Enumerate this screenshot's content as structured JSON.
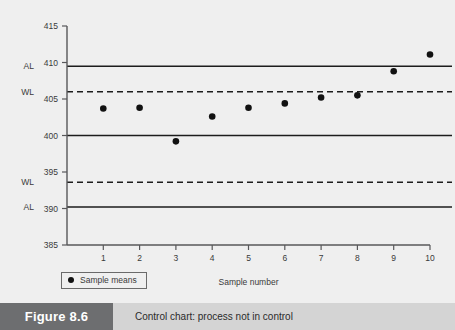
{
  "figure": {
    "number_label": "Figure 8.6",
    "caption": "Control chart: process not in control"
  },
  "legend": {
    "marker_name": "filled-circle-marker",
    "label": "Sample means"
  },
  "chart_data": {
    "type": "scatter",
    "title": "",
    "xlabel": "Sample number",
    "ylabel": "",
    "x": [
      1,
      2,
      3,
      4,
      5,
      6,
      7,
      8,
      9,
      10
    ],
    "categories": [
      "1",
      "2",
      "3",
      "4",
      "5",
      "6",
      "7",
      "8",
      "9",
      "10"
    ],
    "series": [
      {
        "name": "Sample means",
        "values": [
          403.7,
          403.8,
          399.2,
          402.6,
          403.8,
          404.4,
          405.2,
          405.5,
          408.8,
          411.1
        ]
      }
    ],
    "xlim": [
      0,
      10
    ],
    "ylim": [
      385,
      415
    ],
    "xticks": [
      1,
      2,
      3,
      4,
      5,
      6,
      7,
      8,
      9,
      10
    ],
    "yticks": [
      385,
      390,
      395,
      400,
      405,
      410,
      415
    ],
    "ytick_labels": [
      "385",
      "390",
      "395",
      "400",
      "405",
      "410",
      "415"
    ],
    "grid": false,
    "legend_position": "bottom-left",
    "reference_lines": [
      {
        "name": "upper-action-limit",
        "tag": "AL",
        "value": 409.5,
        "style": "solid"
      },
      {
        "name": "upper-warning-limit",
        "tag": "WL",
        "value": 406.0,
        "style": "dashed"
      },
      {
        "name": "center-line",
        "tag": "",
        "value": 400.0,
        "style": "solid"
      },
      {
        "name": "lower-warning-limit",
        "tag": "WL",
        "value": 393.6,
        "style": "dashed"
      },
      {
        "name": "lower-action-limit",
        "tag": "AL",
        "value": 390.2,
        "style": "solid"
      }
    ]
  }
}
